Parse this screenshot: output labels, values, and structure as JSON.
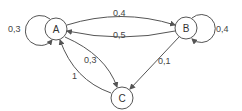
{
  "diagram": {
    "type": "markov-chain",
    "nodes": [
      {
        "id": "A",
        "label": "A"
      },
      {
        "id": "B",
        "label": "B"
      },
      {
        "id": "C",
        "label": "C"
      }
    ],
    "edges": [
      {
        "from": "A",
        "to": "A",
        "label": "0,3"
      },
      {
        "from": "A",
        "to": "B",
        "label": "0,4"
      },
      {
        "from": "B",
        "to": "A",
        "label": "0,5"
      },
      {
        "from": "B",
        "to": "B",
        "label": "0,4"
      },
      {
        "from": "A",
        "to": "C",
        "label": "0,3"
      },
      {
        "from": "C",
        "to": "A",
        "label": "1"
      },
      {
        "from": "B",
        "to": "C",
        "label": "0,1"
      }
    ]
  },
  "colors": {
    "stroke": "#555555",
    "text": "#444444",
    "background": "#ffffff"
  }
}
